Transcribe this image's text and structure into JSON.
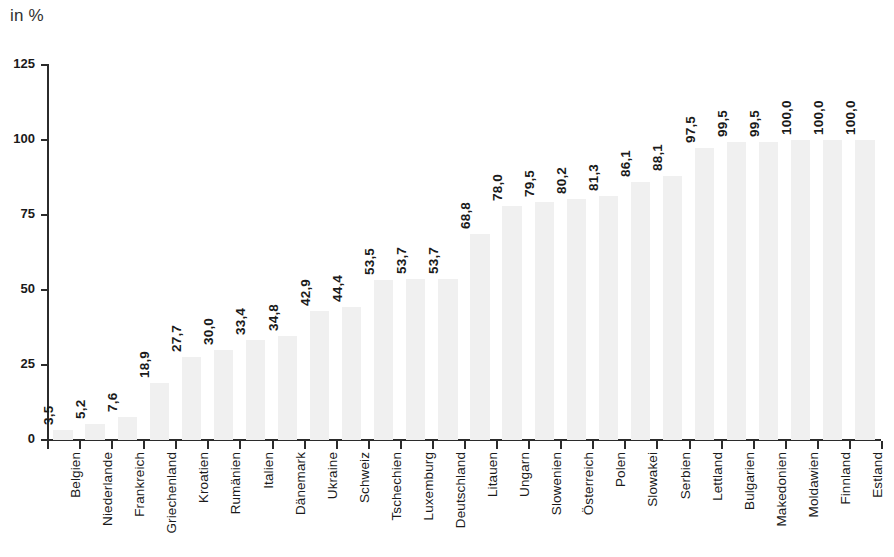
{
  "unit_label": "in %",
  "chart_data": {
    "type": "bar",
    "title": "",
    "subtitle": "",
    "xlabel": "",
    "ylabel": "in %",
    "ylim": [
      0,
      125
    ],
    "yticks": [
      0,
      25,
      50,
      75,
      100,
      125
    ],
    "ytick_labels": [
      "0",
      "25",
      "50",
      "75",
      "100",
      "125"
    ],
    "grid": false,
    "legend": null,
    "bar_color": "#f0f0f0",
    "axis_color": "#2b2b2b",
    "decimal_separator": ",",
    "categories": [
      "Belgien",
      "Niederlande",
      "Frankreich",
      "Griechenland",
      "Kroatien",
      "Rumänien",
      "Italien",
      "Dänemark",
      "Ukraine",
      "Schweiz",
      "Tschechien",
      "Luxemburg",
      "Deutschland",
      "Litauen",
      "Ungarn",
      "Slowenien",
      "Österreich",
      "Polen",
      "Slowakei",
      "Serbien",
      "Lettland",
      "Bulgarien",
      "Makedonien",
      "Moldawien",
      "Finnland",
      "Estland"
    ],
    "values": [
      3.5,
      5.2,
      7.6,
      18.9,
      27.7,
      30.0,
      33.4,
      34.8,
      42.9,
      44.4,
      53.5,
      53.7,
      53.7,
      68.8,
      78.0,
      79.5,
      80.2,
      81.3,
      86.1,
      88.1,
      97.5,
      99.5,
      99.5,
      100.0,
      100.0,
      100.0
    ],
    "value_labels": [
      "3,5",
      "5,2",
      "7,6",
      "18,9",
      "27,7",
      "30,0",
      "33,4",
      "34,8",
      "42,9",
      "44,4",
      "53,5",
      "53,7",
      "53,7",
      "68,8",
      "78,0",
      "79,5",
      "80,2",
      "81,3",
      "86,1",
      "88,1",
      "97,5",
      "99,5",
      "99,5",
      "100,0",
      "100,0",
      "100,0"
    ]
  }
}
